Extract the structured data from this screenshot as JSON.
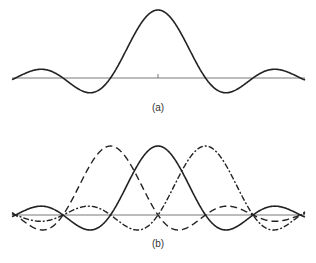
{
  "panels": [
    {
      "id": "a",
      "label": "(a)",
      "description": "sinc function: single central lobe with side lobes"
    },
    {
      "id": "b",
      "label": "(b)",
      "description": "three shifted sinc functions (dashed, solid, dash-dot) sharing zero crossings"
    }
  ],
  "colors": {
    "curve": "#222222",
    "axis": "#555555",
    "background": "#ffffff"
  }
}
